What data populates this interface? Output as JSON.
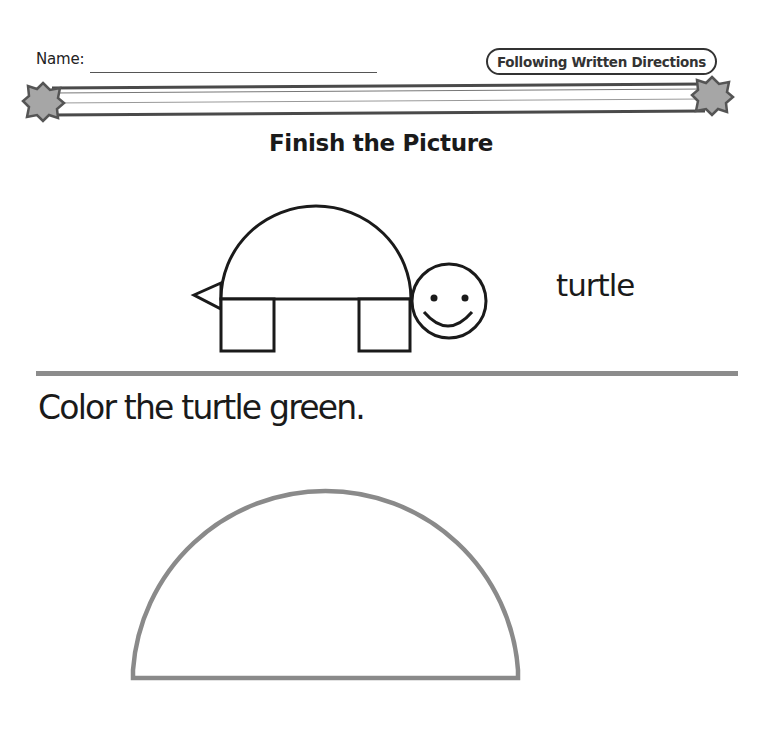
{
  "header": {
    "name_label": "Name:",
    "name_field_value": "",
    "category_badge": "Following Written Directions",
    "banner_icons": [
      "star-octagon-left-icon",
      "star-octagon-right-icon"
    ]
  },
  "worksheet": {
    "title": "Finish the Picture",
    "example": {
      "word": "turtle",
      "picture": "turtle-drawing",
      "parts": [
        "shell half-circle",
        "tail triangle",
        "front leg square",
        "back leg square",
        "smiley face head"
      ]
    },
    "instruction": "Color the turtle green.",
    "task_shape": "half-circle shell outline"
  },
  "colors": {
    "ink": "#1a1a1a",
    "banner_gray": "#8c8c8c",
    "star_fill": "#a6a6a6",
    "shape_outline": "#8a8a8a",
    "background": "#ffffff"
  }
}
